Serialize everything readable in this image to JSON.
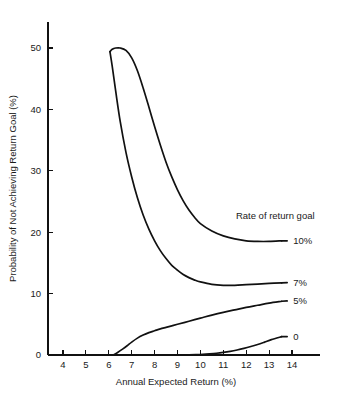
{
  "chart_data": {
    "type": "line",
    "title": "",
    "xlabel": "Annual Expected Return (%)",
    "ylabel": "Probability of Not Achieving Return Goal (%)",
    "xlim": [
      3.4,
      15.2
    ],
    "ylim": [
      0,
      53
    ],
    "xticks": [
      4,
      5,
      6,
      7,
      8,
      9,
      10,
      11,
      12,
      13,
      14
    ],
    "yticks": [
      0,
      10,
      20,
      30,
      40,
      50
    ],
    "xtick_labels": [
      "4",
      "5",
      "6",
      "7",
      "8",
      "9",
      "10",
      "11",
      "12",
      "13",
      "14"
    ],
    "ytick_labels": [
      "0",
      "10",
      "20",
      "30",
      "40",
      "50"
    ],
    "grid": false,
    "legend_position": "inline-right",
    "legend_title": "Rate of return goal",
    "series": [
      {
        "name": "10%",
        "label": "10%",
        "label_x": 14.05,
        "label_y": 18.6,
        "x": [
          6.05,
          6.15,
          6.3,
          6.5,
          6.75,
          7.0,
          7.25,
          7.5,
          7.75,
          8.0,
          8.25,
          8.5,
          8.75,
          9.0,
          9.25,
          9.5,
          9.75,
          10.0,
          10.5,
          11.0,
          11.5,
          12.0,
          12.5,
          13.0,
          13.55
        ],
        "y": [
          49.4,
          49.8,
          50.0,
          50.0,
          49.6,
          48.4,
          46.3,
          43.5,
          40.4,
          37.2,
          34.2,
          31.4,
          29.0,
          26.9,
          25.1,
          23.6,
          22.4,
          21.4,
          20.2,
          19.4,
          18.9,
          18.6,
          18.5,
          18.5,
          18.6
        ]
      },
      {
        "name": "7%",
        "label": "7%",
        "label_x": 14.05,
        "label_y": 11.8,
        "x": [
          6.05,
          6.15,
          6.3,
          6.5,
          6.75,
          7.0,
          7.25,
          7.5,
          7.75,
          8.0,
          8.25,
          8.5,
          8.75,
          9.0,
          9.25,
          9.5,
          9.75,
          10.0,
          10.5,
          11.0,
          11.5,
          12.0,
          12.5,
          13.0,
          13.55
        ],
        "y": [
          49.4,
          47.0,
          43.0,
          38.0,
          33.0,
          29.0,
          25.6,
          22.8,
          20.5,
          18.6,
          17.0,
          15.7,
          14.6,
          13.8,
          13.1,
          12.6,
          12.2,
          11.9,
          11.5,
          11.35,
          11.35,
          11.45,
          11.55,
          11.65,
          11.75
        ]
      },
      {
        "name": "5%",
        "label": "5%",
        "label_x": 14.05,
        "label_y": 8.8,
        "x": [
          6.2,
          6.4,
          6.6,
          6.8,
          7.0,
          7.25,
          7.5,
          7.75,
          8.0,
          8.25,
          8.5,
          8.75,
          9.0,
          9.5,
          10.0,
          10.5,
          11.0,
          11.5,
          12.0,
          12.5,
          13.0,
          13.55
        ],
        "y": [
          0.0,
          0.45,
          0.95,
          1.5,
          2.1,
          2.75,
          3.25,
          3.65,
          3.95,
          4.25,
          4.5,
          4.75,
          5.0,
          5.5,
          6.0,
          6.5,
          6.95,
          7.35,
          7.75,
          8.1,
          8.45,
          8.75
        ]
      },
      {
        "name": "0",
        "label": "0",
        "label_x": 14.05,
        "label_y": 3.0,
        "x": [
          8.9,
          9.2,
          9.5,
          9.8,
          10.1,
          10.4,
          10.7,
          11.0,
          11.3,
          11.6,
          11.9,
          12.2,
          12.5,
          12.8,
          13.1,
          13.55
        ],
        "y": [
          0.0,
          0.0,
          0.02,
          0.05,
          0.1,
          0.18,
          0.28,
          0.42,
          0.6,
          0.82,
          1.08,
          1.38,
          1.72,
          2.1,
          2.5,
          3.0
        ]
      }
    ]
  },
  "colors": {
    "axis": "#111111",
    "line": "#111111",
    "text": "#1a1a1a",
    "background": "#ffffff"
  }
}
